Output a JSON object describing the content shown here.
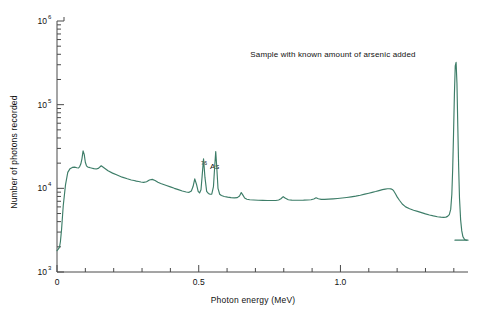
{
  "figure": {
    "note": "Sample with known amount of arsenic added",
    "background_color": "#ffffff",
    "curve_color": "#3d7d68",
    "axis_color": "#4a4a4a"
  },
  "chart_data": {
    "type": "line",
    "title": "Sample with known amount of arsenic added",
    "subtitle": "",
    "xlabel": "Photon energy (MeV)",
    "ylabel": "Number of photons recorded",
    "xscale": "linear",
    "yscale": "log",
    "xlim": [
      0,
      1.45
    ],
    "ylim": [
      1000,
      1000000
    ],
    "grid": false,
    "legend": null,
    "xticks_major": [
      0,
      0.5,
      1.0
    ],
    "xticklabels_major": [
      "0",
      "0.5",
      "1.0"
    ],
    "xticks_minor": [
      0.1,
      0.2,
      0.3,
      0.4,
      0.6,
      0.7,
      0.8,
      0.9,
      1.1,
      1.2,
      1.3,
      1.4
    ],
    "yticks_major": [
      1000,
      10000,
      100000,
      1000000
    ],
    "yticklabels_major": [
      "10",
      "10",
      "10",
      "10"
    ],
    "yticklabel_exponents": [
      "3",
      "4",
      "5",
      "6"
    ],
    "annotations": [
      {
        "text": "As",
        "superscript": "76",
        "x": 0.565,
        "y": 31000,
        "label": "76As"
      }
    ],
    "series": [
      {
        "name": "gamma-ray spectrum",
        "color": "#3d7d68",
        "x": [
          0.0,
          0.003,
          0.006,
          0.009,
          0.012,
          0.016,
          0.022,
          0.03,
          0.038,
          0.046,
          0.054,
          0.062,
          0.07,
          0.076,
          0.08,
          0.084,
          0.088,
          0.092,
          0.096,
          0.1,
          0.104,
          0.108,
          0.113,
          0.118,
          0.124,
          0.13,
          0.138,
          0.146,
          0.156,
          0.168,
          0.18,
          0.196,
          0.212,
          0.23,
          0.248,
          0.262,
          0.272,
          0.28,
          0.288,
          0.296,
          0.306,
          0.316,
          0.326,
          0.336,
          0.346,
          0.356,
          0.366,
          0.376,
          0.386,
          0.4,
          0.414,
          0.428,
          0.442,
          0.456,
          0.466,
          0.474,
          0.48,
          0.486,
          0.492,
          0.498,
          0.503,
          0.508,
          0.512,
          0.517,
          0.522,
          0.528,
          0.534,
          0.54,
          0.546,
          0.552,
          0.556,
          0.56,
          0.564,
          0.568,
          0.574,
          0.58,
          0.59,
          0.602,
          0.614,
          0.626,
          0.636,
          0.644,
          0.65,
          0.656,
          0.662,
          0.67,
          0.68,
          0.694,
          0.71,
          0.726,
          0.742,
          0.758,
          0.772,
          0.782,
          0.79,
          0.798,
          0.806,
          0.816,
          0.828,
          0.842,
          0.856,
          0.87,
          0.884,
          0.896,
          0.906,
          0.914,
          0.922,
          0.932,
          0.944,
          0.958,
          0.974,
          0.99,
          1.006,
          1.022,
          1.038,
          1.054,
          1.07,
          1.086,
          1.1,
          1.112,
          1.124,
          1.136,
          1.148,
          1.158,
          1.166,
          1.172,
          1.178,
          1.183,
          1.188,
          1.194,
          1.2,
          1.208,
          1.218,
          1.23,
          1.244,
          1.258,
          1.272,
          1.286,
          1.3,
          1.314,
          1.328,
          1.342,
          1.354,
          1.364,
          1.372,
          1.378,
          1.384,
          1.389,
          1.393,
          1.396,
          1.399,
          1.402,
          1.405,
          1.408,
          1.411,
          1.414,
          1.417,
          1.42,
          1.424,
          1.428,
          1.432,
          1.438,
          1.445
        ],
        "y": [
          1800,
          1850,
          1900,
          2000,
          2300,
          3200,
          6200,
          11000,
          15500,
          17200,
          17800,
          17900,
          17600,
          17500,
          18200,
          19500,
          22500,
          28000,
          25500,
          20500,
          18600,
          18000,
          17800,
          17600,
          17400,
          17200,
          17000,
          17300,
          18600,
          17400,
          16200,
          15200,
          14400,
          13600,
          13000,
          12600,
          12400,
          12200,
          12050,
          11900,
          11800,
          12000,
          12600,
          12800,
          12400,
          11800,
          11400,
          11100,
          10800,
          10400,
          10000,
          9650,
          9300,
          9050,
          8950,
          9300,
          10500,
          13000,
          11200,
          9200,
          8800,
          9600,
          14000,
          22500,
          13500,
          9200,
          8700,
          8500,
          8500,
          10500,
          17500,
          27500,
          17000,
          10000,
          8500,
          8200,
          8000,
          7850,
          7750,
          7700,
          7750,
          8100,
          8900,
          8300,
          7650,
          7400,
          7300,
          7250,
          7200,
          7180,
          7160,
          7150,
          7160,
          7250,
          7500,
          7950,
          7600,
          7300,
          7220,
          7200,
          7200,
          7220,
          7260,
          7300,
          7450,
          7700,
          7500,
          7380,
          7380,
          7420,
          7480,
          7560,
          7660,
          7780,
          7920,
          8080,
          8280,
          8520,
          8750,
          8950,
          9150,
          9400,
          9650,
          9800,
          9880,
          9900,
          9850,
          9700,
          9300,
          8600,
          7900,
          7200,
          6500,
          6000,
          5700,
          5480,
          5300,
          5120,
          4950,
          4800,
          4680,
          4580,
          4520,
          4500,
          4530,
          4620,
          4850,
          5600,
          8500,
          17000,
          45000,
          130000,
          290000,
          320000,
          180000,
          55000,
          18000,
          7600,
          4200,
          3100,
          2650,
          2450,
          2400
        ]
      },
      {
        "name": "baseline tail",
        "color": "#3d7d68",
        "x": [
          1.404,
          1.412,
          1.425,
          1.44,
          1.45
        ],
        "y": [
          2400,
          2400,
          2400,
          2400,
          2400
        ]
      }
    ]
  }
}
